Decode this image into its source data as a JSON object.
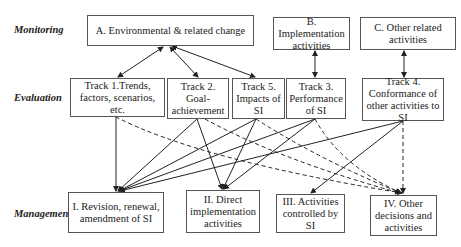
{
  "levels": {
    "monitoring": "Monitoring",
    "evaluation": "Evaluation",
    "management": "Management"
  },
  "monitoring_boxes": {
    "a": "A. Environmental & related change",
    "b": "B. Implementation activities",
    "c": "C. Other related activities"
  },
  "evaluation_boxes": {
    "track1": "Track 1.Trends, factors, scenarios, etc.",
    "track2": "Track 2. Goal-achievement",
    "track5": "Track 5. Impacts of SI",
    "track3": "Track 3. Performance of SI",
    "track4": "Track 4. Conformance of other activities to SI"
  },
  "management_boxes": {
    "i": "I. Revision, renewal, amendment of SI",
    "ii": "II. Direct implementation activities",
    "iii": "III. Activities controlled by SI",
    "iv": "IV. Other decisions and activities"
  },
  "legend": {
    "solid_line": "direct link",
    "dashed_line": "indirect link"
  },
  "colors": {
    "line": "#222222",
    "border": "#555555"
  }
}
